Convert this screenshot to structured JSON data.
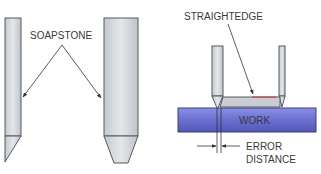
{
  "labels": {
    "soapstone": "SOAPSTONE",
    "straightedge": "STRAIGHTEDGE",
    "work": "WORK",
    "error_line1": "ERROR",
    "error_line2": "DISTANCE"
  },
  "colors": {
    "soapstone_fill": "#d6dadf",
    "soapstone_stroke": "#555a60",
    "work_fill": "#6a6fd0",
    "work_stroke": "#3a3f8a",
    "straightedge_fill": "#c9cdd2",
    "straightedge_top": "#d33030",
    "text": "#3a3a3a"
  }
}
